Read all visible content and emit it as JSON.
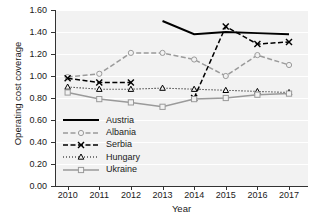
{
  "chart_data": {
    "type": "line",
    "title": "",
    "xlabel": "Year",
    "ylabel": "Operating cost coverage",
    "x": [
      2010,
      2011,
      2012,
      2013,
      2014,
      2015,
      2016,
      2017
    ],
    "categories": [
      "2010",
      "2011",
      "2012",
      "2013",
      "2014",
      "2015",
      "2016",
      "2017"
    ],
    "xlim": [
      2009.6,
      2017.6
    ],
    "ylim": [
      0.0,
      1.6
    ],
    "yticks": [
      0.0,
      0.2,
      0.4,
      0.6,
      0.8,
      1.0,
      1.2,
      1.4,
      1.6
    ],
    "ytick_labels": [
      "0.00",
      "0.20",
      "0.40",
      "0.60",
      "0.80",
      "1.00",
      "1.20",
      "1.40",
      "1.60"
    ],
    "grid": true,
    "grid_axis": "y",
    "legend_position": "center-left-inside",
    "series": [
      {
        "name": "Austria",
        "color": "#000000",
        "style": "solid",
        "marker": "none",
        "values": [
          null,
          null,
          null,
          1.5,
          1.38,
          1.4,
          1.39,
          1.38
        ]
      },
      {
        "name": "Albania",
        "color": "#9a9a9a",
        "style": "dashed",
        "marker": "circle",
        "values": [
          0.99,
          1.02,
          1.21,
          1.21,
          1.15,
          1.0,
          1.19,
          1.1
        ]
      },
      {
        "name": "Serbia",
        "color": "#000000",
        "style": "dashed",
        "marker": "x",
        "values": [
          0.98,
          0.94,
          0.94,
          null,
          0.8,
          1.45,
          1.29,
          1.31
        ]
      },
      {
        "name": "Hungary",
        "color": "#000000",
        "style": "dotted",
        "marker": "triangle",
        "values": [
          0.9,
          0.88,
          0.88,
          0.89,
          0.88,
          0.87,
          0.86,
          0.85
        ]
      },
      {
        "name": "Ukraine",
        "color": "#9a9a9a",
        "style": "solid",
        "marker": "square",
        "values": [
          0.85,
          0.79,
          0.76,
          0.72,
          0.79,
          0.8,
          0.83,
          0.84
        ]
      }
    ]
  },
  "legend": {
    "items": [
      {
        "label": "Austria"
      },
      {
        "label": "Albania"
      },
      {
        "label": "Serbia"
      },
      {
        "label": "Hungary"
      },
      {
        "label": "Ukraine"
      }
    ]
  }
}
